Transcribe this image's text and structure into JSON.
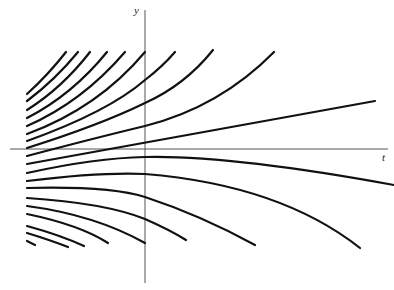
{
  "chart_data": {
    "type": "line",
    "title": "",
    "xlabel": "t",
    "ylabel": "y",
    "grid": false,
    "legend": null,
    "axes": {
      "x_axis": {
        "y": 149,
        "from": 10,
        "to": 388
      },
      "y_axis": {
        "x": 145,
        "from": 10,
        "to": 283
      }
    },
    "series": [
      {
        "name": "c1",
        "path": "M27,94 Q48,75 66,52"
      },
      {
        "name": "c2",
        "path": "M27,101 Q55,80 78,52"
      },
      {
        "name": "c3",
        "path": "M27,110 Q62,88 90,52"
      },
      {
        "name": "c4",
        "path": "M27,118 Q72,95 107,52"
      },
      {
        "name": "c5",
        "path": "M27,126 Q82,102 125,52"
      },
      {
        "name": "c6",
        "path": "M27,134 Q98,108 145,52"
      },
      {
        "name": "c7",
        "path": "M27,141 Q108,112 145,80 Q162,67 175,52"
      },
      {
        "name": "c8",
        "path": "M27,148 Q100,125 145,103 Q185,85 213,50"
      },
      {
        "name": "c9",
        "path": "M27,156 Q95,138 145,126 Q220,107 274,52"
      },
      {
        "name": "line",
        "path": "M27,164 L375,101"
      },
      {
        "name": "c11",
        "path": "M27,173 Q95,158 145,157 Q230,155 394,185"
      },
      {
        "name": "c12",
        "path": "M27,181 Q100,172 145,174 Q280,185 360,248"
      },
      {
        "name": "c13",
        "path": "M27,188 Q100,185 145,197 Q160,203 186,240"
      },
      {
        "name": "c14",
        "path": "M27,198 Q100,200 145,219 L145,219"
      },
      {
        "name": "c15",
        "path": "M27,206 Q95,215 145,243"
      },
      {
        "name": "c16",
        "path": "M27,214 Q80,225 108,243"
      },
      {
        "name": "c17",
        "path": "M27,226 Q60,235 84,246"
      },
      {
        "name": "c18",
        "path": "M27,233 Q50,240 68,247"
      },
      {
        "name": "c19",
        "path": "M27,241 L35,245"
      }
    ],
    "extra_paths": [
      {
        "name": "c14b",
        "path": "M145,219 Q180,235 200,262"
      },
      {
        "name": "c13b",
        "path": "M27,188 Q110,186 145,197 Q200,215 255,245"
      }
    ]
  },
  "labels": {
    "x_axis": "t",
    "y_axis": "y"
  }
}
